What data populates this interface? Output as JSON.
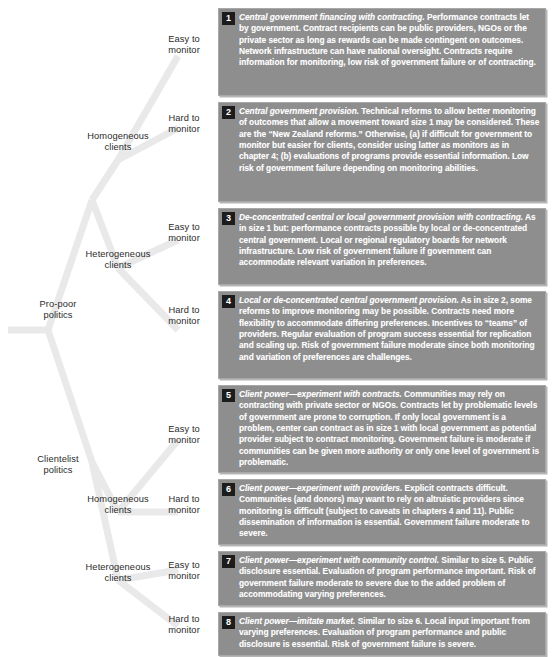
{
  "diagram": {
    "type": "decision-tree",
    "box_color": "#8e8e8e",
    "badge_color": "#1c1c1c",
    "text_color": "#ffffff",
    "line_color": "#e3e3e3"
  },
  "tree": {
    "level1": [
      {
        "label": "Pro-poor\npolitics"
      },
      {
        "label": "Clientelist\npolitics"
      }
    ],
    "level2": [
      {
        "label": "Homogeneous\nclients"
      },
      {
        "label": "Heterogeneous\nclients"
      },
      {
        "label": "Homogeneous\nclients"
      },
      {
        "label": "Heterogeneous\nclients"
      }
    ],
    "level3": [
      {
        "label": "Easy to\nmonitor"
      },
      {
        "label": "Hard to\nmonitor"
      },
      {
        "label": "Easy to\nmonitor"
      },
      {
        "label": "Hard to\nmonitor"
      },
      {
        "label": "Easy to\nmonitor"
      },
      {
        "label": "Hard to\nmonitor"
      },
      {
        "label": "Easy to\nmonitor"
      },
      {
        "label": "Hard to\nmonitor"
      }
    ]
  },
  "boxes": [
    {
      "number": "1",
      "lead": "Central government financing with contracting.",
      "body": " Performance contracts let by government. Contract recipients can be public providers, NGOs or the private sector as long as rewards can be made contingent on outcomes. Network infrastructure can have national oversight. Contracts require information for monitoring, low risk of government failure or of contracting."
    },
    {
      "number": "2",
      "lead": "Central government provision.",
      "body": " Technical reforms to allow better monitoring of outcomes that allow a movement toward size 1 may be considered. These are the “New Zealand reforms.” Otherwise, (a) if difficult for government to monitor but easier for clients, consider using latter as monitors as in chapter 4; (b) evaluations of programs provide essential information. Low risk of government failure depending on monitoring abilities."
    },
    {
      "number": "3",
      "lead": "De-concentrated central or local government provision with contracting.",
      "body": " As in size 1 but: performance contracts possible by local or de-concentrated central government. Local or regional regulatory boards for network infrastructure. Low risk of government failure if government can accommodate relevant variation in preferences."
    },
    {
      "number": "4",
      "lead": "Local or de-concentrated central government provision.",
      "body": " As in size 2, some reforms to improve monitoring may be possible. Contracts need more flexibility to accommodate differing preferences. Incentives to “teams” of providers. Regular evaluation of program success essential for replication and scaling up. Risk of government failure moderate since both monitoring and variation of preferences are challenges."
    },
    {
      "number": "5",
      "lead": "Client power—experiment with contracts.",
      "body": " Communities may rely on contracting with private sector or NGOs. Contracts let by problematic levels of government are prone to corruption. If only local government is a problem, center can contract as in size 1 with local government as potential provider subject to contract monitoring. Government failure is moderate if communities can be given more authority or only one level of government is problematic."
    },
    {
      "number": "6",
      "lead": "Client power—experiment with providers.",
      "body": " Explicit contracts difficult. Communities (and donors) may want to rely on altruistic providers since monitoring is difficult (subject to caveats in chapters 4 and 11). Public dissemination of information is essential. Government failure moderate to severe."
    },
    {
      "number": "7",
      "lead": "Client power—experiment with community control.",
      "body": " Similar to size 5. Public disclosure essential. Evaluation of program performance important. Risk of government failure moderate to severe due to the added problem of accommodating varying preferences."
    },
    {
      "number": "8",
      "lead": "Client power—imitate market.",
      "body": " Similar to size 6. Local input important from varying preferences. Evaluation of program performance and public disclosure is essential. Risk of government failure is severe."
    }
  ]
}
